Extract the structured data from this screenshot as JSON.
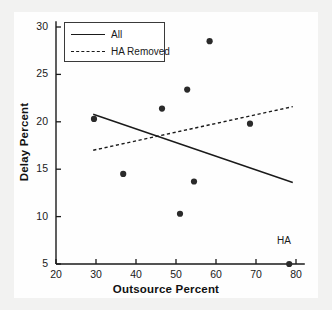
{
  "chart_data": {
    "type": "scatter",
    "title": "",
    "xlabel": "Outsource Percent",
    "ylabel": "Delay Percent",
    "xlim": [
      18.5,
      82.5
    ],
    "ylim": [
      4.0,
      31.0
    ],
    "xticks": [
      20,
      30,
      40,
      50,
      60,
      70,
      80
    ],
    "xtick_labels": [
      "20",
      "30",
      "40",
      "50",
      "60",
      "70",
      "80"
    ],
    "yticks": [
      5,
      10,
      15,
      20,
      25,
      30
    ],
    "ytick_labels": [
      "5",
      "10",
      "15",
      "20",
      "25",
      "30"
    ],
    "grid": false,
    "legend_position": "upper left",
    "points": [
      {
        "x": 29.5,
        "y": 20.3,
        "label": ""
      },
      {
        "x": 36.8,
        "y": 14.5,
        "label": ""
      },
      {
        "x": 46.5,
        "y": 21.4,
        "label": ""
      },
      {
        "x": 51.0,
        "y": 10.3,
        "label": ""
      },
      {
        "x": 52.8,
        "y": 23.4,
        "label": ""
      },
      {
        "x": 54.5,
        "y": 13.7,
        "label": ""
      },
      {
        "x": 58.4,
        "y": 28.5,
        "label": ""
      },
      {
        "x": 68.5,
        "y": 19.8,
        "label": ""
      },
      {
        "x": 78.3,
        "y": 5.0,
        "label": "HA"
      }
    ],
    "annotations": [
      {
        "text": "HA",
        "x": 77.5,
        "y": 7.3
      }
    ],
    "series": [
      {
        "name": "All",
        "style": "solid",
        "color": "#1a1a1a",
        "x": [
          29.3,
          79.2
        ],
        "values": [
          20.8,
          13.6
        ]
      },
      {
        "name": "HA Removed",
        "style": "dashed",
        "color": "#1a1a1a",
        "x": [
          29.3,
          79.2
        ],
        "values": [
          17.0,
          21.6
        ]
      }
    ]
  },
  "legend": {
    "items": [
      {
        "label": "All",
        "style": "solid"
      },
      {
        "label": "HA Removed",
        "style": "dashed"
      }
    ]
  },
  "colors": {
    "marker": "#2a2a2a",
    "line": "#1a1a1a",
    "axis": "#1a1a1a",
    "text": "#1a1a1a",
    "plot_background": "#fefefe",
    "page_background": "#f2f2f1"
  }
}
